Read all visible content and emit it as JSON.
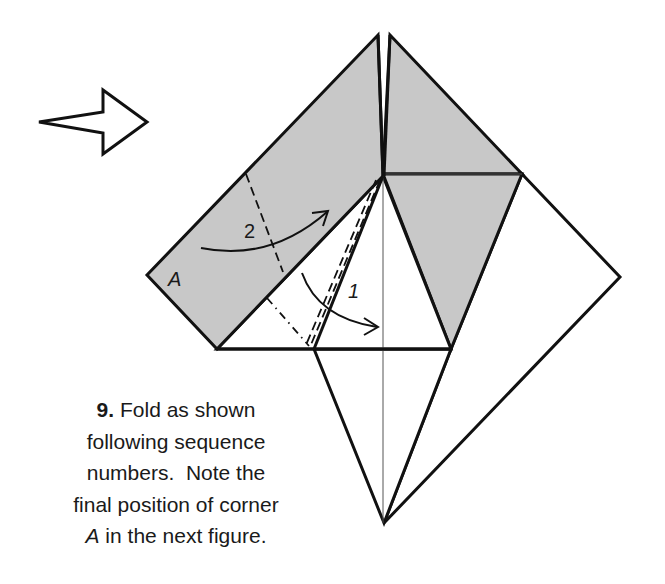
{
  "diagram": {
    "colors": {
      "paper_colored": "#c8c8c8",
      "paper_white": "#ffffff",
      "line": "#111111"
    },
    "labels": {
      "corner": "A",
      "sequence_1": "1",
      "sequence_2": "2"
    },
    "symbols": {
      "view_arrow": "hollow-arrow-pointing-right",
      "fold_arrow_1": "curved-arrow-valley-fold",
      "fold_arrow_2": "curved-arrow-valley-fold"
    }
  },
  "caption": {
    "step_number": "9.",
    "line1_rest": " Fold as shown",
    "line2": "following sequence",
    "line3": "numbers.  Note the",
    "line4": "final position of corner",
    "line5_italic": "A",
    "line5_rest": " in the next figure."
  }
}
